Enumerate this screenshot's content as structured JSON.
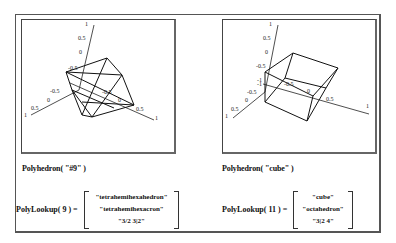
{
  "left": {
    "plot": {
      "axis_ticks_z": [
        "1",
        "0.5",
        "0",
        "-0.5"
      ],
      "axis_ticks_y": [
        "-0.5",
        "0",
        "0.5",
        "1"
      ],
      "axis_ticks_x": [
        "-1",
        "-0.5",
        "0",
        "0.5",
        "1"
      ]
    },
    "caption": "Polyhedron( \"#9\" )",
    "lookup_label": "PolyLookup( 9 )  =",
    "lookup_values": [
      "\"tetrahemihexahedron\"",
      "\"tetrahemihexacron\"",
      "\"3/2 3|2\""
    ]
  },
  "right": {
    "plot": {
      "axis_ticks_z": [
        "1",
        "0.5",
        "0",
        "-0.5"
      ],
      "axis_ticks_y": [
        "-1",
        "-0.5",
        "0",
        "0.5",
        "1"
      ],
      "axis_ticks_x": [
        "-1",
        "-0.5",
        "0",
        "0.5",
        "1"
      ]
    },
    "caption": "Polyhedron( \"cube\" )",
    "lookup_label": "PolyLookup( 11 )  =",
    "lookup_values": [
      "\"cube\"",
      "\"octahedron\"",
      "\"3|2 4\""
    ]
  }
}
